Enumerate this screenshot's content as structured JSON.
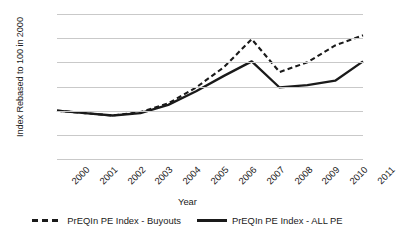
{
  "chart_data": {
    "type": "line",
    "title": "",
    "xlabel": "Year",
    "ylabel": "Index Rebased to 100 in 2000",
    "categories": [
      "2000",
      "2001",
      "2002",
      "2003",
      "2004",
      "2005",
      "2006",
      "2007",
      "2008",
      "2009",
      "2010",
      "2011"
    ],
    "ylim": [
      0,
      300
    ],
    "yticks": [
      0,
      50,
      100,
      150,
      200,
      250,
      300
    ],
    "ytick_labels": [
      "0",
      "50",
      "100",
      "150",
      "200",
      "250",
      "300"
    ],
    "grid": true,
    "legend_position": "bottom",
    "series": [
      {
        "name": "PrEQIn PE Index - Buyouts",
        "style": "dashed",
        "color": "#1a1a1a",
        "values": [
          100,
          95,
          90,
          97,
          115,
          148,
          190,
          248,
          180,
          200,
          235,
          256
        ]
      },
      {
        "name": "PrEQIn PE Index - ALL PE",
        "style": "solid",
        "color": "#1a1a1a",
        "values": [
          100,
          95,
          90,
          95,
          112,
          140,
          172,
          202,
          148,
          153,
          162,
          202
        ]
      }
    ]
  },
  "legend": {
    "items": [
      {
        "label": "PrEQIn PE Index - Buyouts",
        "style": "dashed"
      },
      {
        "label": "PrEQIn PE Index - ALL PE",
        "style": "solid"
      }
    ]
  },
  "axes": {
    "x_title": "Year",
    "y_title": "Index Rebased to 100 in 2000"
  }
}
